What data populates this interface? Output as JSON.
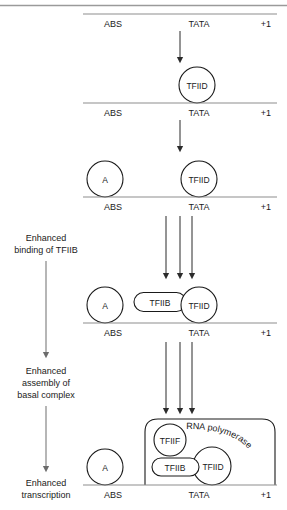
{
  "figure": {
    "top_rule": true,
    "dna_labels": {
      "abs": "ABS",
      "tata": "TATA",
      "start": "+1"
    },
    "stages": [
      {
        "id": "stage-1",
        "dna_y": 14,
        "label_y": 26,
        "factors": [],
        "arrow": {
          "type": "single",
          "x": 180,
          "y1": 31,
          "y2": 62
        }
      },
      {
        "id": "stage-2",
        "dna_y": 103,
        "label_y": 115,
        "factors": [
          {
            "name": "TFIID",
            "shape": "circle",
            "cx": 197,
            "cy": 85,
            "r": 18
          }
        ],
        "arrow": {
          "type": "single",
          "x": 180,
          "y1": 120,
          "y2": 151
        }
      },
      {
        "id": "stage-3",
        "dna_y": 197,
        "label_y": 209,
        "factors": [
          {
            "name": "A",
            "shape": "circle",
            "cx": 105,
            "cy": 179,
            "r": 18
          },
          {
            "name": "TFIID",
            "shape": "circle",
            "cx": 199,
            "cy": 179,
            "r": 18
          }
        ],
        "arrow": {
          "type": "triple",
          "xs": [
            166,
            180,
            192
          ],
          "y1": 214,
          "y2": 278
        }
      },
      {
        "id": "stage-4",
        "dna_y": 323,
        "label_y": 335,
        "factors": [
          {
            "name": "A",
            "shape": "circle",
            "cx": 105,
            "cy": 305,
            "r": 18
          },
          {
            "name": "TFIIB",
            "shape": "roundrect",
            "x": 134,
            "y": 292,
            "w": 52,
            "h": 19
          },
          {
            "name": "TFIID",
            "shape": "circle",
            "cx": 199,
            "cy": 305,
            "r": 18
          }
        ],
        "arrow": {
          "type": "triple",
          "xs": [
            166,
            180,
            192
          ],
          "y1": 340,
          "y2": 412
        }
      },
      {
        "id": "stage-5",
        "dna_y": 485,
        "label_y": 497,
        "factors": [
          {
            "name": "A",
            "shape": "circle",
            "cx": 105,
            "cy": 467,
            "r": 18
          },
          {
            "name": "RNA polymerase",
            "shape": "bigbox",
            "x": 145,
            "y": 419,
            "w": 130,
            "h": 66
          },
          {
            "name": "TFIIF",
            "shape": "circle",
            "cx": 170,
            "cy": 440,
            "r": 16
          },
          {
            "name": "TFIIB",
            "shape": "roundrect",
            "x": 152,
            "y": 458,
            "w": 47,
            "h": 18
          },
          {
            "name": "TFIID",
            "shape": "circle",
            "cx": 212,
            "cy": 466,
            "r": 19
          }
        ],
        "arrow": null
      }
    ],
    "side_arrows": [
      {
        "id": "side-1",
        "caption": [
          "Enhanced",
          "binding of TFIIB"
        ],
        "caption_x": 46,
        "caption_lines_y": [
          238,
          250
        ],
        "x": 46,
        "y1": 258,
        "y2": 356
      },
      {
        "id": "side-2",
        "caption": [
          "Enhanced",
          "assembly of",
          "basal complex"
        ],
        "caption_x": 46,
        "caption_lines_y": [
          371,
          383,
          395
        ],
        "x": 46,
        "y1": 403,
        "y2": 470
      },
      {
        "id": "side-3",
        "caption": [
          "Enhanced",
          "transcription"
        ],
        "caption_x": 46,
        "caption_lines_y": [
          483,
          495
        ],
        "x": 0,
        "y1": 0,
        "y2": 0
      }
    ],
    "dna": {
      "x1": 83,
      "x2": 277
    },
    "label_x": {
      "abs": 113,
      "tata": 199,
      "start": 265
    },
    "colors": {
      "line": "#1a1a1a",
      "rule": "#9a9a9a",
      "arrow": "#333333",
      "text": "#1a1a1a",
      "background": "#ffffff"
    }
  }
}
